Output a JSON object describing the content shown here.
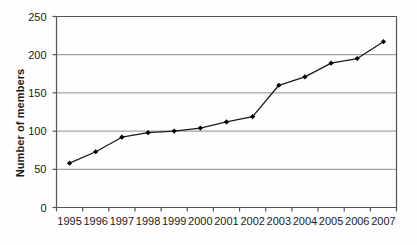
{
  "chart_data": {
    "type": "line",
    "title": "",
    "xlabel": "",
    "ylabel": "Number of members",
    "categories": [
      "1995",
      "1996",
      "1997",
      "1998",
      "1999",
      "2000",
      "2001",
      "2002",
      "2003",
      "2004",
      "2005",
      "2006",
      "2007"
    ],
    "values": [
      58,
      73,
      92,
      98,
      100,
      104,
      112,
      119,
      160,
      171,
      189,
      195,
      217
    ],
    "series": [
      {
        "name": "Number of members",
        "values": [
          58,
          73,
          92,
          98,
          100,
          104,
          112,
          119,
          160,
          171,
          189,
          195,
          217
        ]
      }
    ],
    "ylim": [
      0,
      250
    ],
    "yticks": [
      0,
      50,
      100,
      150,
      200,
      250
    ],
    "ytick_labels": [
      "0",
      "50",
      "100",
      "150",
      "200",
      "250"
    ],
    "grid": true,
    "grid_axis": "y",
    "legend": false,
    "legend_position": "none",
    "marker": "diamond",
    "line_color": "#1a1a1a",
    "marker_color": "#000000",
    "grid_color": "#8c8c8c",
    "axis_color": "#555555",
    "background_color": "#fefefe"
  }
}
